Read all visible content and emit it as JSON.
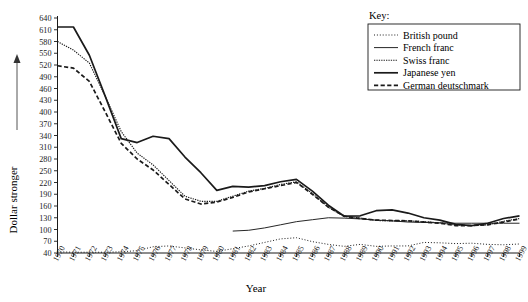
{
  "chart_data": {
    "type": "line",
    "title": "",
    "xlabel": "Year",
    "ylabel": "Dollar stronger",
    "ylabel_arrow": "↑",
    "legend_title": "Key:",
    "legend_position": "top-right",
    "grid": false,
    "xlim": [
      1970,
      1999
    ],
    "ylim": [
      40,
      640
    ],
    "ytick_step": 30,
    "yticks": [
      640,
      610,
      580,
      550,
      520,
      490,
      460,
      430,
      400,
      370,
      340,
      310,
      280,
      250,
      220,
      190,
      160,
      130,
      100,
      70,
      40
    ],
    "ytick_labels": [
      "640",
      "610",
      "580",
      "550",
      "520",
      "490",
      "460",
      "430",
      "400",
      "370",
      "340",
      "310",
      "280",
      "250",
      "220",
      "190",
      "160",
      "130",
      "100",
      "70",
      "40"
    ],
    "categories": [
      1970,
      1971,
      1972,
      1973,
      1974,
      1975,
      1976,
      1977,
      1978,
      1979,
      1980,
      1981,
      1982,
      1983,
      1984,
      1985,
      1986,
      1987,
      1988,
      1989,
      1990,
      1991,
      1992,
      1993,
      1994,
      1995,
      1996,
      1997,
      1998,
      1999
    ],
    "xtick_labels": [
      "1970",
      "1971",
      "1972",
      "1973",
      "1974",
      "1975",
      "1976",
      "1977",
      "1978",
      "1979",
      "1980",
      "1981",
      "1982",
      "1983",
      "1984",
      "1985",
      "1986",
      "1987",
      "1988",
      "1989",
      "1990",
      "1991",
      "1992",
      "1993",
      "1994",
      "1995",
      "1996",
      "1997",
      "1998",
      "1999"
    ],
    "series": [
      {
        "name": "British pound",
        "style": "dotted",
        "start_index": 0,
        "values": [
          43,
          42,
          42,
          42,
          43,
          46,
          56,
          58,
          53,
          48,
          44,
          51,
          58,
          67,
          76,
          79,
          69,
          62,
          57,
          62,
          57,
          58,
          58,
          67,
          66,
          64,
          65,
          62,
          61,
          63
        ]
      },
      {
        "name": "French franc",
        "style": "solid-thin",
        "start_index": 11,
        "values": [
          null,
          null,
          null,
          null,
          null,
          null,
          null,
          null,
          null,
          null,
          null,
          96,
          98,
          104,
          112,
          120,
          125,
          130,
          129,
          127,
          124,
          122,
          119,
          118,
          117,
          116,
          116,
          116,
          116,
          116
        ]
      },
      {
        "name": "Swiss franc",
        "style": "fine-dotted",
        "start_index": 0,
        "values": [
          580,
          558,
          525,
          440,
          350,
          295,
          265,
          225,
          185,
          172,
          172,
          185,
          198,
          205,
          215,
          222,
          192,
          157,
          133,
          129,
          123,
          122,
          122,
          120,
          117,
          111,
          110,
          112,
          121,
          128
        ]
      },
      {
        "name": "Japanese yen",
        "style": "solid-thick",
        "start_index": 0,
        "values": [
          617,
          617,
          545,
          440,
          332,
          322,
          338,
          332,
          285,
          245,
          200,
          210,
          208,
          212,
          222,
          228,
          198,
          162,
          134,
          135,
          148,
          150,
          142,
          130,
          124,
          113,
          110,
          116,
          128,
          135
        ]
      },
      {
        "name": "German deutschmark",
        "style": "dashed",
        "start_index": 0,
        "values": [
          518,
          512,
          478,
          400,
          320,
          280,
          252,
          215,
          178,
          165,
          170,
          182,
          196,
          204,
          212,
          220,
          190,
          157,
          134,
          128,
          124,
          123,
          122,
          119,
          116,
          110,
          110,
          112,
          119,
          127
        ]
      }
    ]
  },
  "legend": {
    "title": "Key:",
    "items": [
      {
        "label": "British pound",
        "style": "dotted"
      },
      {
        "label": "French franc",
        "style": "solid-thin"
      },
      {
        "label": "Swiss franc",
        "style": "fine-dotted"
      },
      {
        "label": "Japanese yen",
        "style": "solid-thick"
      },
      {
        "label": "German deutschmark",
        "style": "dashed"
      }
    ]
  },
  "axes": {
    "y_title": "Dollar stronger",
    "x_title": "Year"
  }
}
